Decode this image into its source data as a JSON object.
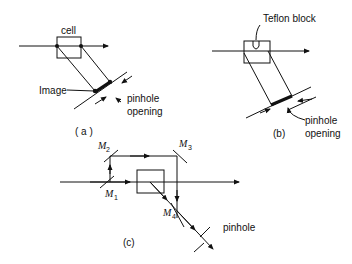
{
  "figure": {
    "panels": [
      {
        "id": "a",
        "caption": "( a )",
        "labels": {
          "cell": "cell",
          "image": "Image",
          "pinhole_line1": "pinhole",
          "pinhole_line2": "opening"
        }
      },
      {
        "id": "b",
        "caption": "(b)",
        "labels": {
          "teflon": "Teflon block",
          "pinhole_line1": "pinhole",
          "pinhole_line2": "opening"
        }
      },
      {
        "id": "c",
        "caption": "(c)",
        "labels": {
          "m1": "M",
          "m1_sub": "1",
          "m2": "M",
          "m2_sub": "2",
          "m3": "M",
          "m3_sub": "3",
          "m4": "M",
          "m4_sub": "4",
          "pinhole": "pinhole"
        }
      }
    ]
  }
}
